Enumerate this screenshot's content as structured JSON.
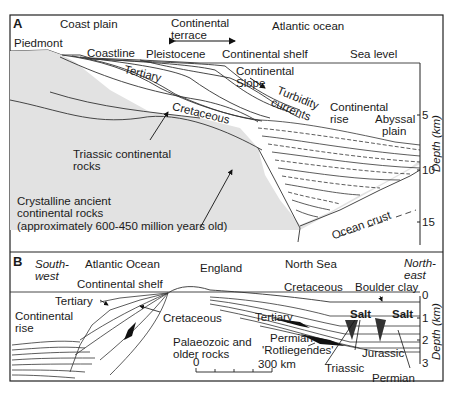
{
  "panel_a": {
    "letter": "A",
    "labels": {
      "coast_plain": "Coast plain",
      "continental_terrace": "Continental terrace",
      "continental_terrace_l1": "Continental",
      "continental_terrace_l2": "terrace",
      "atlantic_ocean": "Atlantic ocean",
      "piedmont": "Piedmont",
      "coastline": "Coastline",
      "pleistocene": "Pleistocene",
      "continental_shelf": "Continental shelf",
      "sea_level": "Sea level",
      "tertiary": "Tertiary",
      "continental_slope_l1": "Continental",
      "continental_slope_l2": "Slope",
      "turbidity_l1": "Turbidity",
      "turbidity_l2": "currents",
      "cretaceous": "Cretaceous",
      "continental_rise_l1": "Continental",
      "continental_rise_l2": "rise",
      "abyssal_l1": "Abyssal",
      "abyssal_l2": "plain",
      "triassic_l1": "Triassic continental",
      "triassic_l2": "rocks",
      "crystalline_l1": "Crystalline ancient",
      "crystalline_l2": "continental rocks",
      "crystalline_l3": "(approximately 600-450 million years old)",
      "ocean_crust": "Ocean crust"
    },
    "depth_axis": {
      "title": "Depth (km)",
      "ticks": [
        "5",
        "10",
        "15"
      ]
    }
  },
  "panel_b": {
    "letter": "B",
    "labels": {
      "southwest_l1": "South-",
      "southwest_l2": "west",
      "atlantic_ocean": "Atlantic Ocean",
      "england": "England",
      "north_sea": "North Sea",
      "northeast_l1": "North-",
      "northeast_l2": "east",
      "continental_shelf": "Continental shelf",
      "cretaceous_left": "Cretaceous",
      "cretaceous_right": "Cretaceous",
      "boulder_clay": "Boulder clay",
      "tertiary_left": "Tertiary",
      "tertiary_right": "Tertiary",
      "continental_rise_l1": "Continental",
      "continental_rise_l2": "rise",
      "salt_1": "Salt",
      "salt_2": "Salt",
      "permian_l1": "Permian",
      "permian_l2": "'Rotliegendes'",
      "palaeozoic_l1": "Palaeozoic and",
      "palaeozoic_l2": "older rocks",
      "jurassic": "Jurassic",
      "triassic": "Triassic",
      "permian": "Permian"
    },
    "scale_bar": {
      "start": "0",
      "end": "300 km"
    },
    "depth_axis": {
      "title": "Depth (km)",
      "ticks": [
        "0",
        "1",
        "2",
        "3"
      ]
    }
  }
}
